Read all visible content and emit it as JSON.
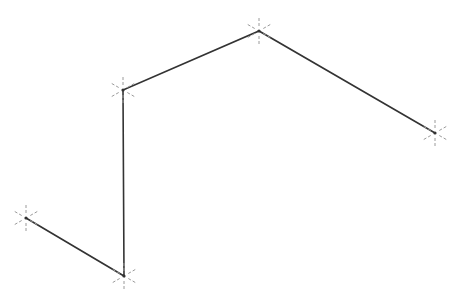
{
  "diagram": {
    "type": "polyline",
    "line_color": "#333333",
    "marker_color": "#9a9a9a",
    "marker_style": "star-dashed",
    "vertices": [
      {
        "x": 26,
        "y": 218
      },
      {
        "x": 124,
        "y": 276
      },
      {
        "x": 123,
        "y": 90
      },
      {
        "x": 259,
        "y": 31
      },
      {
        "x": 435,
        "y": 133
      }
    ]
  }
}
